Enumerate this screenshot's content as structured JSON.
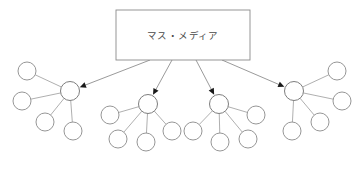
{
  "diagram": {
    "title": "マス・メディア",
    "type": "mass-media-two-step-flow",
    "canvas": {
      "width": 362,
      "height": 170,
      "background": "#ffffff"
    },
    "colors": {
      "node_stroke": "#8a8a8a",
      "line_stroke": "#9a9a9a",
      "arrow_fill": "#1a1a1a",
      "text": "#4a4a4a",
      "node_fill": "#ffffff"
    },
    "source": {
      "label": "マス・メディア",
      "x": 116,
      "y": 10,
      "width": 134,
      "height": 50
    },
    "node_radius": 9,
    "hub_radius": 9.5,
    "clusters": [
      {
        "name": "cluster-left",
        "hub": {
          "cx": 70,
          "cy": 91
        },
        "arrow_from": {
          "x": 150,
          "y": 60
        },
        "satellites": [
          {
            "cx": 27,
            "cy": 71
          },
          {
            "cx": 22,
            "cy": 101
          },
          {
            "cx": 45,
            "cy": 122
          },
          {
            "cx": 73,
            "cy": 131
          }
        ]
      },
      {
        "name": "cluster-mid-left",
        "hub": {
          "cx": 148,
          "cy": 104
        },
        "arrow_from": {
          "x": 172,
          "y": 60
        },
        "satellites": [
          {
            "cx": 110,
            "cy": 115
          },
          {
            "cx": 118,
            "cy": 139
          },
          {
            "cx": 146,
            "cy": 142
          },
          {
            "cx": 172,
            "cy": 131
          }
        ]
      },
      {
        "name": "cluster-mid-right",
        "hub": {
          "cx": 219,
          "cy": 104
        },
        "arrow_from": {
          "x": 196,
          "y": 60
        },
        "satellites": [
          {
            "cx": 193,
            "cy": 131
          },
          {
            "cx": 220,
            "cy": 142
          },
          {
            "cx": 248,
            "cy": 139
          },
          {
            "cx": 256,
            "cy": 115
          }
        ]
      },
      {
        "name": "cluster-right",
        "hub": {
          "cx": 294,
          "cy": 91
        },
        "arrow_from": {
          "x": 222,
          "y": 60
        },
        "satellites": [
          {
            "cx": 292,
            "cy": 131
          },
          {
            "cx": 320,
            "cy": 122
          },
          {
            "cx": 342,
            "cy": 101
          },
          {
            "cx": 337,
            "cy": 71
          }
        ]
      }
    ]
  }
}
